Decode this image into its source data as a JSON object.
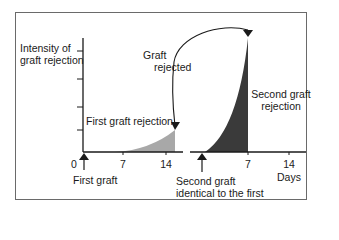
{
  "diagram": {
    "y_axis_label_line1": "Intensity of",
    "y_axis_label_line2": "graft rejection",
    "first_curve_label": "First graft rejection",
    "arrow_label_line1": "Graft",
    "arrow_label_line2": "rejected",
    "second_curve_label_line1": "Second graft",
    "second_curve_label_line2": "rejection",
    "first_event_label": "First graft",
    "second_event_label_line1": "Second graft",
    "second_event_label_line2": "identical to the first",
    "x_axis_unit": "Days",
    "first_axis_ticks": [
      "0",
      "7",
      "14"
    ],
    "second_axis_ticks": [
      "7",
      "14"
    ],
    "colors": {
      "first_rejection_fill": "#a8a8a8",
      "second_rejection_fill": "#3a3a3a",
      "axis": "#1a1a1a",
      "frame": "#6a6a6a"
    }
  }
}
